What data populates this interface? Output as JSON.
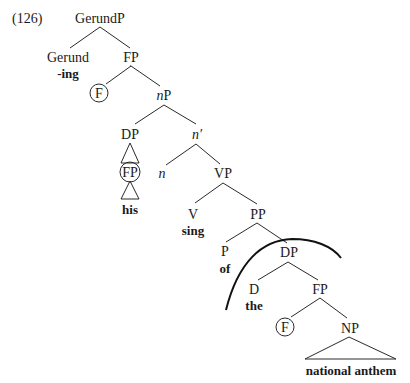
{
  "example_number": "(126)",
  "nodes": {
    "gerundp": "GerundP",
    "gerund": "Gerund",
    "gerund_lex": "-ing",
    "fp1": "FP",
    "f1": "F",
    "np_little_head": "n",
    "np_little_p": "P",
    "dp1": "DP",
    "fp_his": "FP",
    "his": "his",
    "nbar": "n′",
    "n": "n",
    "vp": "VP",
    "v": "V",
    "sing": "sing",
    "pp": "PP",
    "p": "P",
    "of": "of",
    "dp2": "DP",
    "d": "D",
    "the": "the",
    "fp2": "FP",
    "f2": "F",
    "np": "NP",
    "national_anthem": "national anthem"
  },
  "annotations": {
    "circled_nodes": [
      "F",
      "FP",
      "F"
    ],
    "arc": "boundary arc over DP (of the national anthem)"
  }
}
